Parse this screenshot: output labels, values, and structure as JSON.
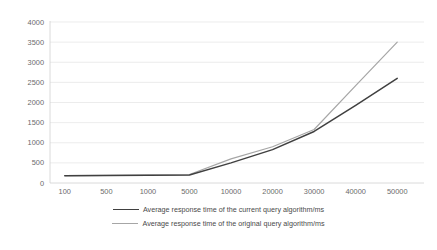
{
  "chart_data": {
    "type": "line",
    "title": "",
    "xlabel": "",
    "ylabel": "",
    "categories": [
      "100",
      "500",
      "1000",
      "5000",
      "10000",
      "20000",
      "30000",
      "40000",
      "50000"
    ],
    "yticks": [
      "0",
      "500",
      "1000",
      "1500",
      "2000",
      "2500",
      "3000",
      "3500",
      "4000"
    ],
    "ylim": [
      0,
      4000
    ],
    "grid": true,
    "legend_position": "bottom",
    "series": [
      {
        "name": "Average response time of the current query algorithm/ms",
        "color": "#404040",
        "values": [
          180,
          185,
          190,
          200,
          500,
          830,
          1280,
          1930,
          2600
        ]
      },
      {
        "name": "Average response time of the original query algorithm/ms",
        "color": "#a6a6a6",
        "values": [
          185,
          190,
          195,
          210,
          600,
          900,
          1330,
          2420,
          3500
        ]
      }
    ]
  }
}
